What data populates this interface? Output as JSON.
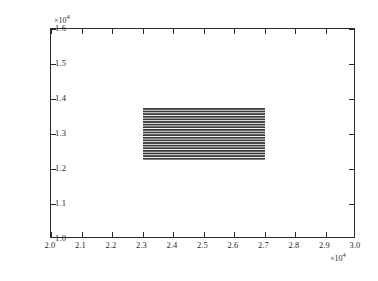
{
  "figure": {
    "background_color": "#ffffff",
    "axis_color": "#2b2b2b",
    "patch_color": "#3a3a3a"
  },
  "axes": {
    "x_exponent_label": "×10",
    "x_exponent_power": "4",
    "y_exponent_label": "×10",
    "y_exponent_power": "4"
  },
  "chart_data": {
    "type": "area",
    "title": "",
    "xlabel": "",
    "ylabel": "",
    "xlim": [
      20000,
      30000
    ],
    "ylim": [
      10000,
      16000
    ],
    "x_tick_values": [
      20000,
      21000,
      22000,
      23000,
      24000,
      25000,
      26000,
      27000,
      28000,
      29000,
      30000
    ],
    "x_tick_labels": [
      "2.0",
      "2.1",
      "2.2",
      "2.3",
      "2.4",
      "2.5",
      "2.6",
      "2.7",
      "2.8",
      "2.9",
      "3.0"
    ],
    "x_tick_multiplier": "×10⁴",
    "y_tick_values": [
      10000,
      11000,
      12000,
      13000,
      14000,
      15000,
      16000
    ],
    "y_tick_labels": [
      "1.0",
      "1.1",
      "1.2",
      "1.3",
      "1.4",
      "1.5",
      "1.6"
    ],
    "y_tick_multiplier": "×10⁴",
    "grid": false,
    "legend": null,
    "tick_direction": "in",
    "box": true,
    "series": [
      {
        "name": "hatched-region",
        "style": "horizontal-line-hatch",
        "x_range": [
          23000,
          27000
        ],
        "y_range": [
          12250,
          13750
        ],
        "line_count": 21,
        "line_color": "#3a3a3a",
        "fill": "none"
      }
    ],
    "annotations": []
  }
}
